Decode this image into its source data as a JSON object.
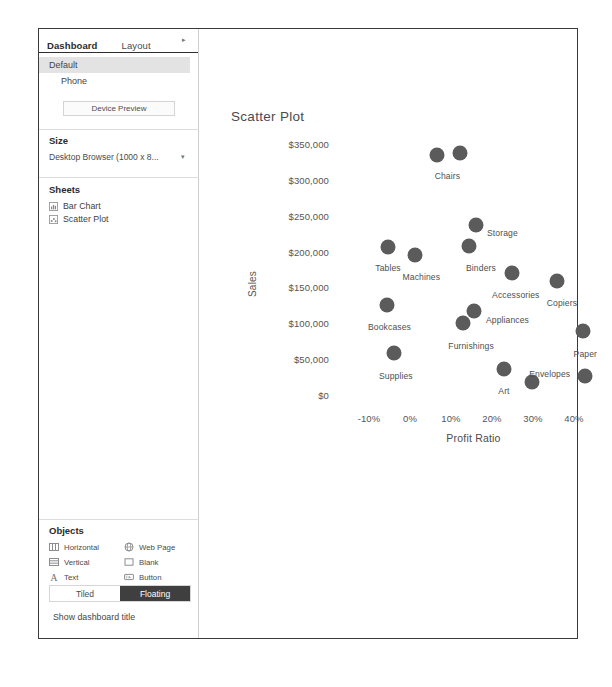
{
  "panel": {
    "tabs": [
      {
        "label": "Dashboard",
        "active": true
      },
      {
        "label": "Layout",
        "active": false
      }
    ],
    "tab_overflow_caret": "▸"
  },
  "sidebar": {
    "device_preview": {
      "items": [
        {
          "label": "Default",
          "selected": true
        },
        {
          "label": "Phone",
          "selected": false
        }
      ],
      "button_label": "Device Preview"
    },
    "size": {
      "title": "Size",
      "selected": "Desktop Browser (1000 x 8...",
      "caret": "▾"
    },
    "sheets": {
      "title": "Sheets",
      "items": [
        {
          "label": "Bar Chart",
          "icon": "bar-chart-icon"
        },
        {
          "label": "Scatter Plot",
          "icon": "scatter-plot-icon"
        }
      ]
    },
    "objects": {
      "title": "Objects",
      "items": [
        {
          "label": "Horizontal",
          "icon": "horizontal-container-icon"
        },
        {
          "label": "Web Page",
          "icon": "web-page-icon"
        },
        {
          "label": "Vertical",
          "icon": "vertical-container-icon"
        },
        {
          "label": "Blank",
          "icon": "blank-icon"
        },
        {
          "label": "Text",
          "icon": "text-icon"
        },
        {
          "label": "Button",
          "icon": "button-icon"
        },
        {
          "label": "Image",
          "icon": "image-icon"
        },
        {
          "label": "Extension",
          "icon": "extension-icon"
        }
      ]
    },
    "layout_toggle": {
      "tiled_label": "Tiled",
      "floating_label": "Floating",
      "active": "Floating"
    },
    "show_dashboard_title": "Show dashboard title"
  },
  "chart_data": {
    "type": "scatter",
    "title": "Scatter Plot",
    "xlabel": "Profit Ratio",
    "ylabel": "Sales",
    "xlim": [
      -0.15,
      0.46
    ],
    "ylim": [
      0,
      368000
    ],
    "xticks": [
      "-10%",
      "0%",
      "10%",
      "20%",
      "30%",
      "40%"
    ],
    "xtick_values": [
      -0.1,
      0.0,
      0.1,
      0.2,
      0.3,
      0.4
    ],
    "yticks": [
      "$0",
      "$50,000",
      "$100,000",
      "$150,000",
      "$200,000",
      "$250,000",
      "$300,000",
      "$350,000"
    ],
    "ytick_values": [
      0,
      50000,
      100000,
      150000,
      200000,
      250000,
      300000,
      350000
    ],
    "grid": false,
    "legend": "none",
    "marker_color": "#5b5b5b",
    "points": [
      {
        "label": "Chairs",
        "x": 0.065,
        "y": 335000,
        "label_dx": -2,
        "label_dy": 16,
        "labeled": true
      },
      {
        "label": "",
        "x": 0.121,
        "y": 337000,
        "label_dx": 0,
        "label_dy": 0,
        "labeled": false
      },
      {
        "label": "Storage",
        "x": 0.161,
        "y": 237000,
        "label_dx": 11,
        "label_dy": 3,
        "labeled": true
      },
      {
        "label": "Tables",
        "x": -0.053,
        "y": 206000,
        "label_dx": -13,
        "label_dy": 16,
        "labeled": true
      },
      {
        "label": "Binders",
        "x": 0.144,
        "y": 208000,
        "label_dx": -3,
        "label_dy": 17,
        "labeled": true
      },
      {
        "label": "Machines",
        "x": 0.011,
        "y": 195000,
        "label_dx": -12,
        "label_dy": 17,
        "labeled": true
      },
      {
        "label": "Accessories",
        "x": 0.249,
        "y": 170000,
        "label_dx": -20,
        "label_dy": 17,
        "labeled": true
      },
      {
        "label": "Copiers",
        "x": 0.358,
        "y": 159000,
        "label_dx": -10,
        "label_dy": 17,
        "labeled": true
      },
      {
        "label": "Bookcases",
        "x": -0.056,
        "y": 126000,
        "label_dx": -19,
        "label_dy": 17,
        "labeled": true
      },
      {
        "label": "Appliances",
        "x": 0.156,
        "y": 117000,
        "label_dx": 12,
        "label_dy": 4,
        "labeled": true
      },
      {
        "label": "Furnishings",
        "x": 0.13,
        "y": 100000,
        "label_dx": -15,
        "label_dy": 18,
        "labeled": true
      },
      {
        "label": "Paper",
        "x": 0.421,
        "y": 89000,
        "label_dx": -9,
        "label_dy": 18,
        "labeled": true
      },
      {
        "label": "Supplies",
        "x": -0.039,
        "y": 58000,
        "label_dx": -15,
        "label_dy": 18,
        "labeled": true
      },
      {
        "label": "Art",
        "x": 0.23,
        "y": 36000,
        "label_dx": -6,
        "label_dy": 17,
        "labeled": true
      },
      {
        "label": "Envelopes",
        "x": 0.298,
        "y": 18000,
        "label_dx": -3,
        "label_dy": -13,
        "labeled": true
      },
      {
        "label": "",
        "x": 0.427,
        "y": 27000,
        "label_dx": 0,
        "label_dy": 0,
        "labeled": false
      }
    ]
  }
}
